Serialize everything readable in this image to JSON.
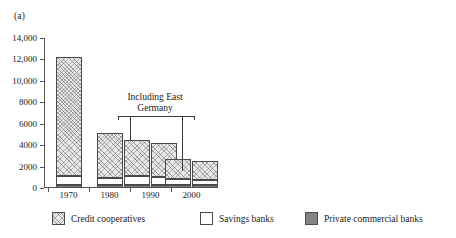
{
  "panels": {
    "a": {
      "label": "(a)"
    },
    "b": {
      "label": "(b)"
    }
  },
  "annotation": {
    "line1": "Including East",
    "line2": "Germany"
  },
  "legend": {
    "items": [
      {
        "key": "coop",
        "label": "Credit cooperatives",
        "swatch": "hatched"
      },
      {
        "key": "savings",
        "label": "Savings banks",
        "swatch": "white"
      },
      {
        "key": "private",
        "label": "Private commercial banks",
        "swatch": "gray"
      }
    ]
  },
  "colors": {
    "credit_cooperatives": "#e8e8e8",
    "savings_banks": "#ffffff",
    "private_commercial_banks": "#848484",
    "outline": "#4a4a4a",
    "axis": "#555555",
    "text": "#1a1a1a"
  },
  "chart_data": [
    {
      "id": "panel-a",
      "type": "bar",
      "stacked": true,
      "title": "(a)",
      "xlabel": "",
      "ylabel": "",
      "axis_position": "left",
      "grid": false,
      "legend_position": "bottom",
      "ylim": [
        0,
        14000
      ],
      "yticks": [
        0,
        2000,
        4000,
        6000,
        8000,
        10000,
        12000,
        14000
      ],
      "ytick_labels": [
        "0",
        "2000",
        "4000",
        "6000",
        "8000",
        "10,000",
        "12,000",
        "14,000"
      ],
      "categories": [
        "1970",
        "1980",
        "1990",
        "2000"
      ],
      "bars": [
        {
          "group": "1970",
          "variant": "west",
          "private": 240,
          "savings": 860,
          "coop": 11100,
          "total": 12200
        },
        {
          "group": "1980",
          "variant": "west",
          "private": 240,
          "savings": 660,
          "coop": 4200,
          "total": 5100
        },
        {
          "group": "1990",
          "variant": "west",
          "private": 280,
          "savings": 820,
          "coop": 3400,
          "total": 4500
        },
        {
          "group": "1990",
          "variant": "including-east",
          "private": 280,
          "savings": 760,
          "coop": 3120,
          "total": 4160
        },
        {
          "group": "2000",
          "variant": "west",
          "private": 260,
          "savings": 560,
          "coop": 1880,
          "total": 2700
        },
        {
          "group": "2000",
          "variant": "including-east",
          "private": 260,
          "savings": 520,
          "coop": 1720,
          "total": 2500
        }
      ],
      "series": [
        {
          "name": "Private commercial banks",
          "values": [
            240,
            240,
            280,
            280,
            260,
            260
          ]
        },
        {
          "name": "Savings banks",
          "values": [
            860,
            660,
            820,
            760,
            560,
            520
          ]
        },
        {
          "name": "Credit cooperatives",
          "values": [
            11100,
            4200,
            3400,
            3120,
            1880,
            1720
          ]
        }
      ],
      "annotations": [
        {
          "text": "Including East Germany",
          "applies_to": [
            "1990 second bar",
            "2000 second bar"
          ]
        }
      ]
    },
    {
      "id": "panel-b",
      "type": "bar",
      "stacked": true,
      "title": "(b)",
      "xlabel": "",
      "ylabel": "",
      "axis_position": "right",
      "grid": false,
      "legend_position": "bottom",
      "ylim": [
        0,
        50000
      ],
      "yticks": [
        0,
        10000,
        20000,
        30000,
        40000,
        50000
      ],
      "ytick_labels": [
        "0",
        "10,000",
        "20,000",
        "30,000",
        "40,000",
        "50,000"
      ],
      "categories": [
        "1970",
        "1980",
        "1990",
        "2000"
      ],
      "bars": [
        {
          "group": "1970",
          "variant": "west",
          "private": 4600,
          "savings": 15900,
          "coop": 11000,
          "total": 31500
        },
        {
          "group": "1980",
          "variant": "west",
          "private": 5200,
          "savings": 17800,
          "coop": 15600,
          "total": 38600
        },
        {
          "group": "1990",
          "variant": "west",
          "private": 5600,
          "savings": 19800,
          "coop": 18200,
          "total": 43600
        },
        {
          "group": "1990",
          "variant": "including-east",
          "private": 5600,
          "savings": 17400,
          "coop": 15800,
          "total": 38800
        },
        {
          "group": "2000",
          "variant": "west",
          "private": 6100,
          "savings": 17500,
          "coop": 15600,
          "total": 39200
        },
        {
          "group": "2000",
          "variant": "including-east",
          "private": 4900,
          "savings": 14800,
          "coop": 14300,
          "total": 34000
        }
      ],
      "series": [
        {
          "name": "Private commercial banks",
          "values": [
            4600,
            5200,
            5600,
            5600,
            6100,
            4900
          ]
        },
        {
          "name": "Savings banks",
          "values": [
            15900,
            17800,
            19800,
            17400,
            17500,
            14800
          ]
        },
        {
          "name": "Credit cooperatives",
          "values": [
            11000,
            15600,
            18200,
            15800,
            15600,
            14300
          ]
        }
      ],
      "annotations": [
        {
          "text": "Including East Germany",
          "applies_to": [
            "1990 second bar",
            "2000 second bar"
          ]
        }
      ]
    }
  ]
}
